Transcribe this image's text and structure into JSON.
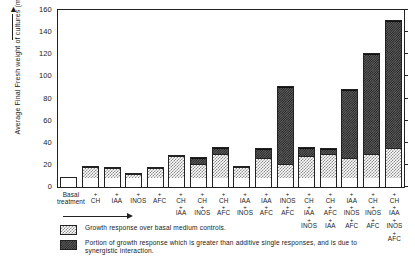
{
  "chart_data": {
    "type": "bar",
    "title": "",
    "xlabel": "Basal treatment",
    "ylabel": "Average Final Fresh weight of cultures (mg)",
    "ylim": [
      0,
      160
    ],
    "yticks": [
      0,
      20,
      40,
      60,
      80,
      100,
      120,
      140,
      160
    ],
    "grid": false,
    "legend_position": "below-axes",
    "categories": [
      "Basal treatment",
      "+ CH",
      "+ IAA",
      "+ INOS",
      "+ AFC",
      "+ CH + IAA",
      "+ CH + INOS",
      "+ CH + AFC",
      "+ IAA + INOS",
      "+ IAA + AFC",
      "+ INOS + AFC",
      "+ CH + IAA + INOS",
      "+ CH + AFC + IAA",
      "+ IAA + INOS + AFC",
      "+ CH + INOS + AFC",
      "+ CH + IAA + INOS + AFC"
    ],
    "category_lines": [
      [
        "Basal",
        "treatment"
      ],
      [
        "+",
        "CH"
      ],
      [
        "+",
        "IAA"
      ],
      [
        "+",
        "INOS"
      ],
      [
        "+",
        "AFC"
      ],
      [
        "+",
        "CH",
        "+",
        "IAA"
      ],
      [
        "+",
        "CH",
        "+",
        "INOS"
      ],
      [
        "+",
        "CH",
        "+",
        "AFC"
      ],
      [
        "+",
        "IAA",
        "+",
        "INOS"
      ],
      [
        "+",
        "IAA",
        "+",
        "AFC"
      ],
      [
        "+",
        "INOS",
        "+",
        "AFC"
      ],
      [
        "+",
        "CH",
        "+",
        "IAA",
        "+",
        "INOS"
      ],
      [
        "+",
        "CH",
        "+",
        "AFC",
        "+",
        "IAA"
      ],
      [
        "+",
        "IAA",
        "+",
        "INOS",
        "+",
        "AFC"
      ],
      [
        "+",
        "CH",
        "+",
        "INOS",
        "+",
        "AFC"
      ],
      [
        "+",
        "CH",
        "+",
        "IAA",
        "+",
        "INOS",
        "+",
        "AFC"
      ]
    ],
    "series": [
      {
        "name": "Basal medium control level",
        "key": "basal",
        "values": [
          8,
          8,
          8,
          8,
          8,
          8,
          8,
          8,
          8,
          8,
          8,
          8,
          8,
          8,
          8,
          8
        ]
      },
      {
        "name": "Growth response over basal medium controls",
        "key": "growth",
        "values": [
          0,
          10,
          9,
          4,
          9,
          20,
          13,
          22,
          10,
          18,
          13,
          20,
          22,
          18,
          22,
          27
        ]
      },
      {
        "name": "Portion of growth response which is greater than additive single responses, and is due to synergistic interaction",
        "key": "synergistic",
        "values": [
          0,
          0,
          0,
          0,
          0,
          0,
          5,
          5,
          0,
          8,
          69,
          7,
          4,
          62,
          90,
          115
        ]
      }
    ],
    "totals": [
      8,
      18,
      17,
      12,
      17,
      28,
      26,
      30,
      18,
      34,
      90,
      35,
      34,
      88,
      120,
      150
    ]
  },
  "legend": {
    "items": [
      {
        "swatch": "growth",
        "text": "Growth response over basal medium controls."
      },
      {
        "swatch": "syn",
        "text": "Portion of growth response which is greater than additive single responses, and is due to synergistic interaction."
      }
    ]
  },
  "axis": {
    "y_title": "Average Final Fresh weight of cultures (mg)",
    "y_arrow": "▲",
    "basal_line_1": "Basal",
    "basal_line_2": "treatment"
  }
}
